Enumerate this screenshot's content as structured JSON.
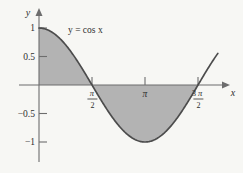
{
  "figure": {
    "title": "",
    "curve_label": "y = cos x",
    "x_axis_name": "x",
    "y_axis_name": "y"
  },
  "axes": {
    "y_ticks": [
      {
        "label": "1",
        "value": 1
      },
      {
        "label": "0.5",
        "value": 0.5
      },
      {
        "label": "−0.5",
        "value": -0.5
      },
      {
        "label": "−1",
        "value": -1
      }
    ],
    "x_ticks": [
      {
        "label": "π/2",
        "numerator": "",
        "pi": "π",
        "denominator": "2",
        "value": 1.5708
      },
      {
        "label": "π",
        "numerator": "",
        "pi": "π",
        "denominator": "",
        "value": 3.1416
      },
      {
        "label": "3π/2",
        "numerator": "3",
        "pi": "π",
        "denominator": "2",
        "value": 4.7124
      }
    ]
  },
  "colors": {
    "background": "#f7f7f4",
    "shade": "#b3b3b3",
    "curve": "#4c4c4c",
    "axis": "#6d6d6d",
    "text": "#2e2e2e"
  },
  "chart_data": {
    "type": "line",
    "title": "",
    "subtitle": "",
    "xlabel": "x",
    "ylabel": "y",
    "xlim": [
      -0.35,
      5.45
    ],
    "ylim": [
      -1.45,
      1.3
    ],
    "grid": false,
    "legend": null,
    "annotations": [
      {
        "text": "y = cos x",
        "x": 1.05,
        "y": 0.93
      }
    ],
    "xtick_values": [
      1.5708,
      3.1416,
      4.7124
    ],
    "xtick_labels": [
      "π/2",
      "π",
      "3π/2"
    ],
    "ytick_values": [
      1,
      0.5,
      -0.5,
      -1
    ],
    "ytick_labels": [
      "1",
      "0.5",
      "−0.5",
      "−1"
    ],
    "series": [
      {
        "name": "y = cos x",
        "function": "cos(x)",
        "x": [
          0,
          0.2618,
          0.5236,
          0.7854,
          1.0472,
          1.309,
          1.5708,
          1.8326,
          2.0944,
          2.3562,
          2.618,
          2.8798,
          3.1416,
          3.4034,
          3.6652,
          3.927,
          4.1888,
          4.4506,
          4.7124,
          4.9742,
          5.236,
          5.3
        ],
        "y": [
          1.0,
          0.966,
          0.866,
          0.707,
          0.5,
          0.259,
          0.0,
          -0.259,
          -0.5,
          -0.707,
          -0.866,
          -0.966,
          -1.0,
          -0.966,
          -0.866,
          -0.707,
          -0.5,
          -0.259,
          0.0,
          0.259,
          0.5,
          0.555
        ]
      }
    ],
    "shaded_regions": [
      {
        "from": 0,
        "to": 1.5708,
        "between": "curve and y=0",
        "sign": "positive"
      },
      {
        "from": 1.5708,
        "to": 4.7124,
        "between": "curve and y=0",
        "sign": "negative"
      }
    ]
  }
}
